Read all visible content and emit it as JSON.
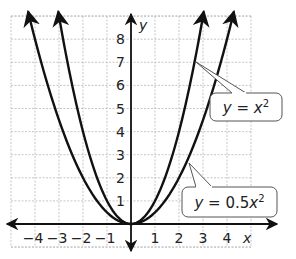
{
  "chart_data": {
    "type": "line",
    "title": "",
    "xlabel": "x",
    "ylabel": "y",
    "xlim": [
      -5,
      5
    ],
    "ylim": [
      -1,
      9
    ],
    "grid": true,
    "x_ticks": [
      "−4",
      "−3",
      "−2",
      "−1",
      "1",
      "2",
      "3",
      "4"
    ],
    "y_ticks": [
      "1",
      "2",
      "3",
      "4",
      "5",
      "6",
      "7",
      "8"
    ],
    "series": [
      {
        "name": "y = x^2",
        "label_main": "y = x",
        "label_sup": "2",
        "function": "x^2",
        "x": [
          -3,
          -2,
          -1,
          0,
          1,
          2,
          3
        ],
        "values": [
          9,
          4,
          1,
          0,
          1,
          4,
          9
        ]
      },
      {
        "name": "y = 0.5x^2",
        "label_main": "y = 0.5x",
        "label_sup": "2",
        "function": "0.5x^2",
        "x": [
          -4,
          -3,
          -2,
          -1,
          0,
          1,
          2,
          3,
          4
        ],
        "values": [
          8,
          4.5,
          2,
          0.5,
          0,
          0.5,
          2,
          4.5,
          8
        ]
      }
    ],
    "annotations": [
      "y = x²",
      "y = 0.5x²"
    ]
  }
}
